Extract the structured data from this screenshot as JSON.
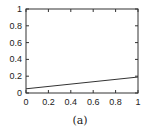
{
  "chart_data": {
    "type": "line",
    "title": "",
    "xlabel": "",
    "ylabel": "",
    "caption": "(a)",
    "xlim": [
      0,
      1
    ],
    "ylim": [
      0,
      1
    ],
    "grid": false,
    "legend": null,
    "x_ticks": [
      "0",
      "0.2",
      "0.4",
      "0.6",
      "0.8",
      "1"
    ],
    "y_ticks": [
      "0",
      "0.2",
      "0.4",
      "0.6",
      "0.8",
      "1"
    ],
    "series": [
      {
        "name": "line",
        "color": "#333333",
        "x": [
          0,
          1
        ],
        "y": [
          0.05,
          0.19
        ]
      }
    ]
  }
}
